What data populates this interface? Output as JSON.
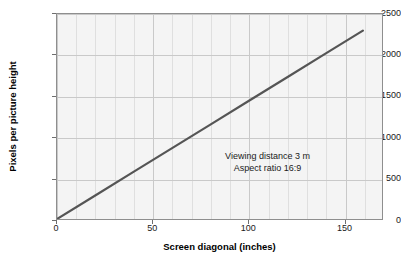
{
  "chart_data": {
    "type": "line",
    "title": "",
    "xlabel": "Screen diagonal (inches)",
    "ylabel": "Pixels per picture height",
    "xlim": [
      0,
      170
    ],
    "ylim": [
      0,
      2500
    ],
    "xticks": [
      0,
      50,
      100,
      150
    ],
    "yticks": [
      0,
      500,
      1000,
      1500,
      2000,
      2500
    ],
    "xtick_labels": [
      "0",
      "50",
      "100",
      "150"
    ],
    "ytick_labels": [
      "0",
      "500",
      "1000",
      "1500",
      "2000",
      "2500"
    ],
    "x_minor_step": 10,
    "grid": true,
    "legend": "none",
    "series": [
      {
        "name": "Pixels per picture height",
        "color": "#555555",
        "x": [
          0,
          20,
          40,
          60,
          80,
          100,
          120,
          140,
          160
        ],
        "values": [
          0,
          287,
          574,
          861,
          1148,
          1436,
          1723,
          2010,
          2297
        ]
      }
    ],
    "annotations": [
      {
        "line1": "Viewing distance 3 m",
        "line2": "Aspect ratio 16:9"
      }
    ]
  },
  "annotation": {
    "viewing_distance": "Viewing distance 3 m",
    "aspect_ratio": "Aspect ratio 16:9"
  },
  "axes": {
    "x_title": "Screen diagonal (inches)",
    "y_title": "Pixels per picture height"
  },
  "colors": {
    "line": "#555555",
    "plot_background": "#f4f4f4",
    "grid_minor": "#dfdfdf",
    "grid_major": "#c9c9c9",
    "frame": "#8e8e8e"
  }
}
